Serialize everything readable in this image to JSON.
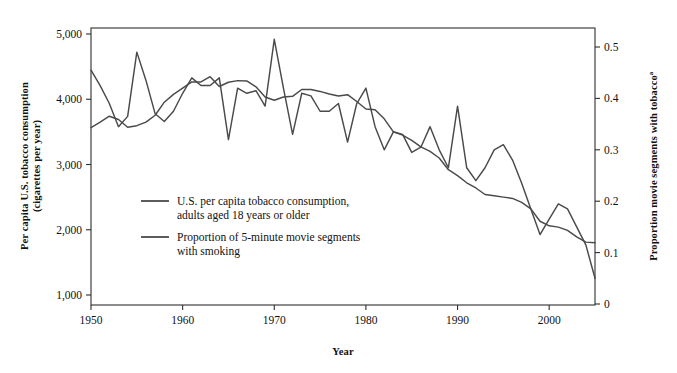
{
  "figure": {
    "background_color": "#ffffff",
    "line_color": "#4a4a4a",
    "axis_color": "#2e2e2e",
    "text_color": "#111111"
  },
  "axes": {
    "x_title": "Year",
    "y_left_title_line1": "Per capita U.S. tobacco consumption",
    "y_left_title_line2": "(cigarettes per year)",
    "y_right_title": "Proportion movie segments with tobacco",
    "y_right_title_superscript": "a",
    "x_ticks": [
      "1950",
      "1960",
      "1970",
      "1980",
      "1990",
      "2000"
    ],
    "y_left_ticks": [
      "5,000",
      "4,000",
      "3,000",
      "2,000",
      "1,000"
    ],
    "y_right_ticks": [
      "0.5",
      "0.4",
      "0.3",
      "0.2",
      "0.1",
      "0"
    ]
  },
  "legend": {
    "entries": [
      {
        "line1": "U.S. per capita tobacco consumption,",
        "line2": "adults aged 18 years or older",
        "color": "#4a4a4a"
      },
      {
        "line1": "Proportion of 5-minute movie segments",
        "line2": "with smoking",
        "color": "#4a4a4a"
      }
    ]
  },
  "chart_data": {
    "type": "line",
    "title": "",
    "subtitle": "",
    "xlabel": "Year",
    "ylabel": "Per capita U.S. tobacco consumption (cigarettes per year)",
    "ylabel_right": "Proportion movie segments with tobacco",
    "grid": false,
    "legend_position": "inside-lower-left",
    "xlim": [
      1950,
      2005
    ],
    "ylim": [
      1000,
      5100
    ],
    "ylim_right": [
      0,
      0.53
    ],
    "x": [
      1950,
      1951,
      1952,
      1953,
      1954,
      1955,
      1956,
      1957,
      1958,
      1959,
      1960,
      1961,
      1962,
      1963,
      1964,
      1965,
      1966,
      1967,
      1968,
      1969,
      1970,
      1971,
      1972,
      1973,
      1974,
      1975,
      1976,
      1977,
      1978,
      1979,
      1980,
      1981,
      1982,
      1983,
      1984,
      1985,
      1986,
      1987,
      1988,
      1989,
      1990,
      1991,
      1992,
      1993,
      1994,
      1995,
      1996,
      1997,
      1998,
      1999,
      2000,
      2001,
      2002,
      2003,
      2004,
      2005
    ],
    "series": [
      {
        "name": "U.S. per capita tobacco consumption, adults aged 18 years or older",
        "axis": "left",
        "color": "#4a4a4a",
        "values": [
          3565,
          3650,
          3740,
          3690,
          3570,
          3595,
          3650,
          3755,
          3955,
          4075,
          4170,
          4265,
          4265,
          4345,
          4195,
          4260,
          4285,
          4280,
          4190,
          4035,
          3985,
          4035,
          4045,
          4150,
          4150,
          4120,
          4080,
          4050,
          4070,
          3965,
          3850,
          3840,
          3700,
          3500,
          3450,
          3370,
          3270,
          3200,
          3100,
          2920,
          2830,
          2720,
          2640,
          2540,
          2520,
          2500,
          2480,
          2420,
          2320,
          2130,
          2060,
          2040,
          1990,
          1890,
          1810,
          1800
        ]
      },
      {
        "name": "Proportion of 5-minute movie segments with smoking",
        "axis": "right",
        "color": "#4a4a4a",
        "values": [
          0.455,
          0.425,
          0.39,
          0.345,
          0.365,
          0.49,
          0.435,
          0.37,
          0.355,
          0.375,
          0.41,
          0.44,
          0.425,
          0.425,
          0.44,
          0.32,
          0.42,
          0.41,
          0.415,
          0.385,
          0.515,
          0.42,
          0.33,
          0.41,
          0.405,
          0.375,
          0.375,
          0.39,
          0.315,
          0.39,
          0.42,
          0.345,
          0.3,
          0.335,
          0.33,
          0.295,
          0.305,
          0.345,
          0.3,
          0.265,
          0.385,
          0.265,
          0.24,
          0.265,
          0.3,
          0.31,
          0.28,
          0.235,
          0.185,
          0.135,
          0.165,
          0.195,
          0.185,
          0.15,
          0.115,
          0.05
        ]
      }
    ]
  }
}
